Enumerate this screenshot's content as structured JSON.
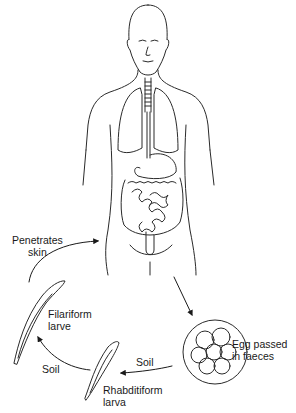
{
  "diagram": {
    "labels": {
      "penetrates": [
        "Penetrates",
        "skin"
      ],
      "filariform": [
        "Filariform",
        "larve"
      ],
      "soil_left": "Soil",
      "soil_right": "Soil",
      "rhabditiform": [
        "Rhabditiform",
        "larva"
      ],
      "egg": [
        "Egg passed",
        "in faeces"
      ]
    },
    "stages": [
      "Human host (intestine)",
      "Egg passed in faeces",
      "Rhabditiform larva",
      "Filariform larve",
      "Penetrates skin"
    ],
    "colors": {
      "line": "#2a2a2a",
      "background": "#ffffff"
    }
  }
}
